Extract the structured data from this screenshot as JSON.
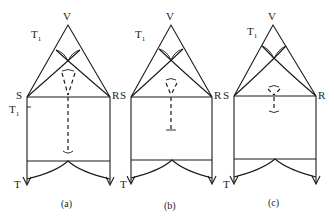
{
  "figure": {
    "panels": [
      {
        "id": "a",
        "caption": "(a)",
        "labels": {
          "apex": "V",
          "left": "S",
          "right": "R",
          "t1_top": "T",
          "t1_top_sub": "1",
          "t1_side": "T",
          "t1_side_sub": "1",
          "bottom_left": "T"
        },
        "geometry": {
          "vx": 68,
          "vy": 25,
          "sx": 27,
          "rx": 110,
          "base_y": 97,
          "cone_top_y": 70,
          "stem_bottom_y": 153,
          "bottom_line_y": 161,
          "arrow_y": 184
        }
      },
      {
        "id": "b",
        "caption": "(b)",
        "labels": {
          "apex": "V",
          "left": "S",
          "right": "R",
          "t1_top": "T",
          "t1_top_sub": "1",
          "bottom_left": "T"
        },
        "geometry": {
          "vx": 171,
          "vy": 25,
          "sx": 131,
          "rx": 212,
          "base_y": 97,
          "cone_top_y": 79,
          "stem_bottom_y": 130,
          "bottom_line_y": 160,
          "arrow_y": 183
        }
      },
      {
        "id": "c",
        "caption": "(c)",
        "labels": {
          "apex": "V",
          "left": "S",
          "right": "R",
          "t1_top": "T",
          "t1_top_sub": "1",
          "bottom_left": "T"
        },
        "geometry": {
          "vx": 273,
          "vy": 25,
          "sx": 234,
          "rx": 316,
          "base_y": 96,
          "cone_top_y": 86,
          "stem_bottom_y": 112,
          "bottom_line_y": 159,
          "arrow_y": 183
        }
      }
    ]
  }
}
